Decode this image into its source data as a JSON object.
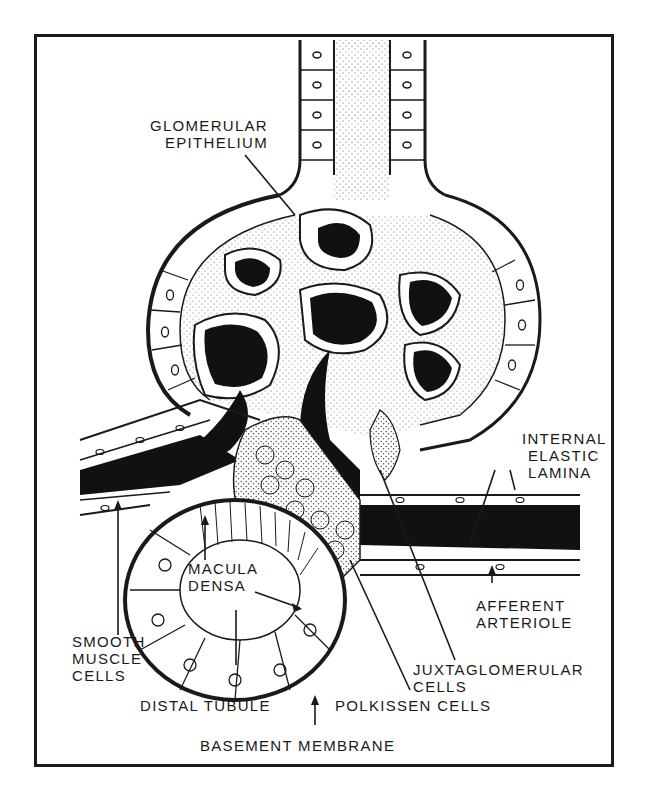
{
  "figure": {
    "colors": {
      "ink": "#1a1a1a",
      "paper": "#ffffff",
      "stipple": "#555555"
    },
    "labels": {
      "glomerular_epithelium": {
        "line1": "GLOMERULAR",
        "line2": "EPITHELIUM"
      },
      "internal_elastic_lamina": {
        "line1": "INTERNAL",
        "line2": "ELASTIC",
        "line3": "LAMINA"
      },
      "macula_densa": {
        "line1": "MACULA",
        "line2": "DENSA"
      },
      "smooth_muscle_cells": {
        "line1": "SMOOTH",
        "line2": "MUSCLE",
        "line3": "CELLS"
      },
      "afferent_arteriole": {
        "line1": "AFFERENT",
        "line2": "ARTERIOLE"
      },
      "juxtaglomerular_cells": {
        "line1": "JUXTAGLOMERULAR",
        "line2": "CELLS"
      },
      "distal_tubule": "DISTAL TUBULE",
      "polkissen_cells": "POLKISSEN CELLS",
      "basement_membrane": "BASEMENT MEMBRANE"
    }
  }
}
